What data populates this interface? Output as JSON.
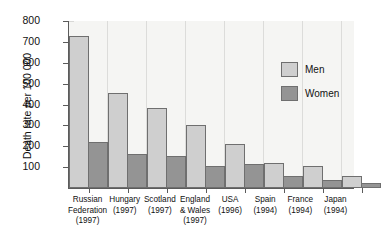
{
  "chart_data": {
    "type": "bar",
    "title": "",
    "xlabel": "",
    "ylabel": "Death rate per 100 000",
    "ylim": [
      0,
      800
    ],
    "yticks": [
      0,
      100,
      200,
      300,
      400,
      500,
      600,
      700,
      800
    ],
    "ytick_labels": [
      "",
      "100",
      "200",
      "300",
      "400",
      "500",
      "600",
      "700",
      "800"
    ],
    "grid": false,
    "legend_position": "top-right",
    "categories": [
      "Russian Federation (1997)",
      "Hungary (1997)",
      "Scotland (1997)",
      "England & Wales (1997)",
      "USA (1996)",
      "Spain (1994)",
      "France (1994)",
      "Japan (1994)"
    ],
    "category_lines": [
      [
        "Russian",
        "Federation",
        "(1997)"
      ],
      [
        "Hungary",
        "(1997)"
      ],
      [
        "Scotland",
        "(1997)"
      ],
      [
        "England",
        "& Wales",
        "(1997)"
      ],
      [
        "USA",
        "(1996)"
      ],
      [
        "Spain",
        "(1994)"
      ],
      [
        "France",
        "(1994)"
      ],
      [
        "Japan",
        "(1994)"
      ]
    ],
    "series": [
      {
        "name": "Men",
        "color": "#cfcfcf",
        "values": [
          730,
          455,
          385,
          302,
          212,
          122,
          105,
          58
        ]
      },
      {
        "name": "Women",
        "color": "#949494",
        "values": [
          220,
          165,
          155,
          105,
          115,
          58,
          38,
          25
        ]
      }
    ]
  },
  "legend": {
    "items": [
      {
        "label": "Men",
        "color": "#cfcfcf"
      },
      {
        "label": "Women",
        "color": "#949494"
      }
    ]
  },
  "axis": {
    "y_title": "Death rate per 100 000"
  },
  "colors": {
    "men": "#cfcfcf",
    "women": "#949494",
    "axis": "#5b5b5b",
    "plot_background": "#f5f5f3",
    "page_background": "#ffffff"
  }
}
